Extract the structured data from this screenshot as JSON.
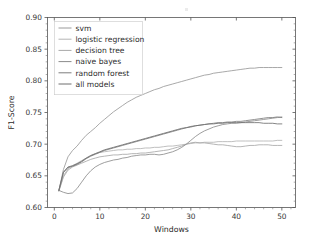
{
  "figure": {
    "background_color": "#ffffff",
    "has_title": false,
    "title": ""
  },
  "chart_data": {
    "type": "line",
    "title": "",
    "xlabel": "Windows",
    "ylabel": "F1-Score",
    "xlim": [
      -1.5,
      53
    ],
    "ylim": [
      0.6,
      0.9
    ],
    "xticks": [
      0,
      10,
      20,
      30,
      40,
      50
    ],
    "xticklabels": [
      "0",
      "10",
      "20",
      "30",
      "40",
      "50"
    ],
    "yticks": [
      0.6,
      0.65,
      0.7,
      0.75,
      0.8,
      0.85,
      0.9
    ],
    "yticklabels": [
      "0.60",
      "0.65",
      "0.70",
      "0.75",
      "0.80",
      "0.85",
      "0.90"
    ],
    "minor_yticks": [
      0.61,
      0.62,
      0.63,
      0.64,
      0.66,
      0.67,
      0.68,
      0.69,
      0.71,
      0.72,
      0.73,
      0.74,
      0.76,
      0.77,
      0.78,
      0.79,
      0.81,
      0.82,
      0.83,
      0.84,
      0.86,
      0.87,
      0.88,
      0.89
    ],
    "grid": false,
    "legend_position": "upper left",
    "x": [
      1,
      2,
      3,
      4,
      5,
      6,
      7,
      8,
      9,
      10,
      11,
      12,
      13,
      14,
      15,
      16,
      17,
      18,
      19,
      20,
      21,
      22,
      23,
      24,
      25,
      26,
      27,
      28,
      29,
      30,
      31,
      32,
      33,
      34,
      35,
      36,
      37,
      38,
      39,
      40,
      41,
      42,
      43,
      44,
      45,
      46,
      47,
      48,
      49,
      50
    ],
    "series": [
      {
        "name": "svm",
        "color": "#9a9a9a",
        "values": [
          0.627,
          0.66,
          0.68,
          0.69,
          0.697,
          0.706,
          0.714,
          0.72,
          0.726,
          0.733,
          0.739,
          0.745,
          0.751,
          0.756,
          0.761,
          0.766,
          0.77,
          0.774,
          0.777,
          0.78,
          0.783,
          0.786,
          0.788,
          0.791,
          0.793,
          0.795,
          0.797,
          0.799,
          0.801,
          0.803,
          0.805,
          0.807,
          0.809,
          0.81,
          0.812,
          0.813,
          0.814,
          0.815,
          0.816,
          0.817,
          0.818,
          0.819,
          0.82,
          0.82,
          0.821,
          0.821,
          0.821,
          0.821,
          0.821,
          0.821
        ]
      },
      {
        "name": "logistic regression",
        "color": "#b4b4b4",
        "values": [
          0.626,
          0.65,
          0.661,
          0.666,
          0.67,
          0.674,
          0.678,
          0.682,
          0.685,
          0.687,
          0.688,
          0.689,
          0.69,
          0.691,
          0.691,
          0.692,
          0.692,
          0.693,
          0.693,
          0.694,
          0.694,
          0.695,
          0.695,
          0.696,
          0.697,
          0.697,
          0.698,
          0.699,
          0.7,
          0.701,
          0.702,
          0.702,
          0.703,
          0.703,
          0.703,
          0.704,
          0.704,
          0.704,
          0.704,
          0.705,
          0.705,
          0.705,
          0.705,
          0.705,
          0.705,
          0.705,
          0.705,
          0.705,
          0.706,
          0.706
        ]
      },
      {
        "name": "decision tree",
        "color": "#a8a8a8",
        "values": [
          0.626,
          0.648,
          0.659,
          0.664,
          0.667,
          0.67,
          0.673,
          0.676,
          0.678,
          0.68,
          0.681,
          0.682,
          0.683,
          0.683,
          0.684,
          0.684,
          0.685,
          0.685,
          0.686,
          0.686,
          0.687,
          0.688,
          0.689,
          0.69,
          0.691,
          0.693,
          0.695,
          0.697,
          0.7,
          0.702,
          0.703,
          0.702,
          0.702,
          0.701,
          0.7,
          0.699,
          0.699,
          0.698,
          0.697,
          0.696,
          0.696,
          0.697,
          0.698,
          0.698,
          0.699,
          0.699,
          0.699,
          0.698,
          0.698,
          0.698
        ]
      },
      {
        "name": "naive bayes",
        "color": "#8c8c8c",
        "values": [
          0.627,
          0.624,
          0.622,
          0.623,
          0.63,
          0.64,
          0.65,
          0.658,
          0.664,
          0.668,
          0.671,
          0.673,
          0.675,
          0.676,
          0.678,
          0.679,
          0.681,
          0.682,
          0.683,
          0.683,
          0.684,
          0.684,
          0.683,
          0.684,
          0.686,
          0.688,
          0.691,
          0.695,
          0.7,
          0.706,
          0.712,
          0.717,
          0.721,
          0.724,
          0.727,
          0.729,
          0.731,
          0.732,
          0.733,
          0.733,
          0.734,
          0.735,
          0.736,
          0.737,
          0.738,
          0.739,
          0.74,
          0.741,
          0.742,
          0.743
        ]
      },
      {
        "name": "random forest",
        "color": "#7e7e7e",
        "values": [
          0.627,
          0.655,
          0.663,
          0.665,
          0.668,
          0.672,
          0.677,
          0.681,
          0.684,
          0.687,
          0.69,
          0.692,
          0.694,
          0.696,
          0.698,
          0.7,
          0.702,
          0.704,
          0.706,
          0.708,
          0.71,
          0.712,
          0.714,
          0.716,
          0.718,
          0.72,
          0.722,
          0.724,
          0.726,
          0.727,
          0.729,
          0.73,
          0.731,
          0.732,
          0.733,
          0.734,
          0.734,
          0.735,
          0.735,
          0.736,
          0.736,
          0.737,
          0.738,
          0.739,
          0.74,
          0.741,
          0.742,
          0.742,
          0.743,
          0.742
        ]
      },
      {
        "name": "all models",
        "color": "#6f6f6f",
        "values": [
          0.627,
          0.656,
          0.664,
          0.666,
          0.669,
          0.673,
          0.678,
          0.682,
          0.685,
          0.688,
          0.691,
          0.693,
          0.695,
          0.697,
          0.699,
          0.701,
          0.703,
          0.705,
          0.707,
          0.709,
          0.711,
          0.713,
          0.715,
          0.717,
          0.719,
          0.721,
          0.723,
          0.725,
          0.726,
          0.728,
          0.729,
          0.73,
          0.731,
          0.732,
          0.732,
          0.733,
          0.733,
          0.734,
          0.734,
          0.734,
          0.734,
          0.734,
          0.734,
          0.734,
          0.734,
          0.733,
          0.733,
          0.733,
          0.732,
          0.732
        ]
      }
    ]
  },
  "legend": {
    "items": [
      {
        "label": "svm"
      },
      {
        "label": "logistic regression"
      },
      {
        "label": "decision tree"
      },
      {
        "label": "naive bayes"
      },
      {
        "label": "random forest"
      },
      {
        "label": "all models"
      }
    ]
  }
}
